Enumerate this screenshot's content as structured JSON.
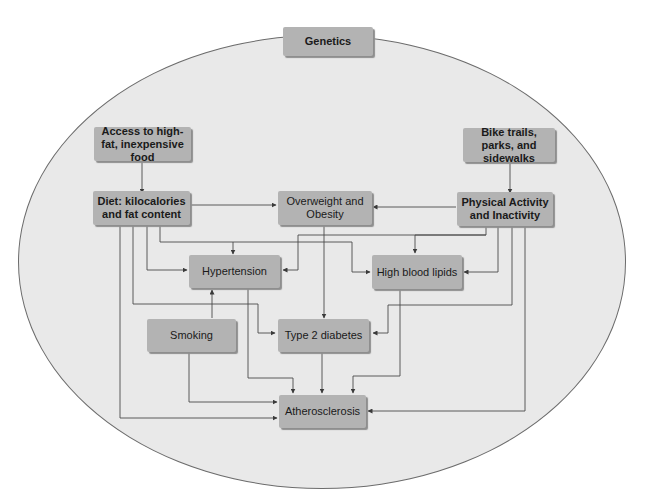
{
  "diagram": {
    "colors": {
      "ellipse_fill": "#e9e9e9",
      "ellipse_border": "#6c6c6c",
      "box_fill": "#b3b3b3",
      "line": "#4a4a4a"
    },
    "nodes": {
      "genetics": {
        "label": "Genetics",
        "bold": true
      },
      "access_food": {
        "label": "Access to high-fat, inexpensive food",
        "bold": true
      },
      "bike_trails": {
        "label": "Bike trails, parks, and sidewalks",
        "bold": true
      },
      "diet": {
        "label": "Diet: kilocalories and fat content",
        "bold": true
      },
      "overweight": {
        "label": "Overweight and Obesity",
        "bold": false
      },
      "physical_activity": {
        "label": "Physical Activity and Inactivity",
        "bold": true
      },
      "hypertension": {
        "label": "Hypertension",
        "bold": false
      },
      "high_blood_lipids": {
        "label": "High blood lipids",
        "bold": false
      },
      "smoking": {
        "label": "Smoking",
        "bold": false
      },
      "type2_diabetes": {
        "label": "Type 2 diabetes",
        "bold": false
      },
      "atherosclerosis": {
        "label": "Atherosclerosis",
        "bold": false
      }
    },
    "edges": [
      {
        "from": "access_food",
        "to": "diet"
      },
      {
        "from": "bike_trails",
        "to": "physical_activity"
      },
      {
        "from": "diet",
        "to": "overweight"
      },
      {
        "from": "physical_activity",
        "to": "overweight"
      },
      {
        "from": "diet",
        "to": "hypertension"
      },
      {
        "from": "diet",
        "to": "high_blood_lipids"
      },
      {
        "from": "diet",
        "to": "type2_diabetes"
      },
      {
        "from": "diet",
        "to": "atherosclerosis"
      },
      {
        "from": "physical_activity",
        "to": "hypertension"
      },
      {
        "from": "physical_activity",
        "to": "high_blood_lipids"
      },
      {
        "from": "physical_activity",
        "to": "type2_diabetes"
      },
      {
        "from": "physical_activity",
        "to": "atherosclerosis"
      },
      {
        "from": "overweight",
        "to": "type2_diabetes"
      },
      {
        "from": "smoking",
        "to": "hypertension"
      },
      {
        "from": "smoking",
        "to": "atherosclerosis"
      },
      {
        "from": "hypertension",
        "to": "atherosclerosis"
      },
      {
        "from": "type2_diabetes",
        "to": "atherosclerosis"
      },
      {
        "from": "high_blood_lipids",
        "to": "atherosclerosis"
      }
    ]
  }
}
